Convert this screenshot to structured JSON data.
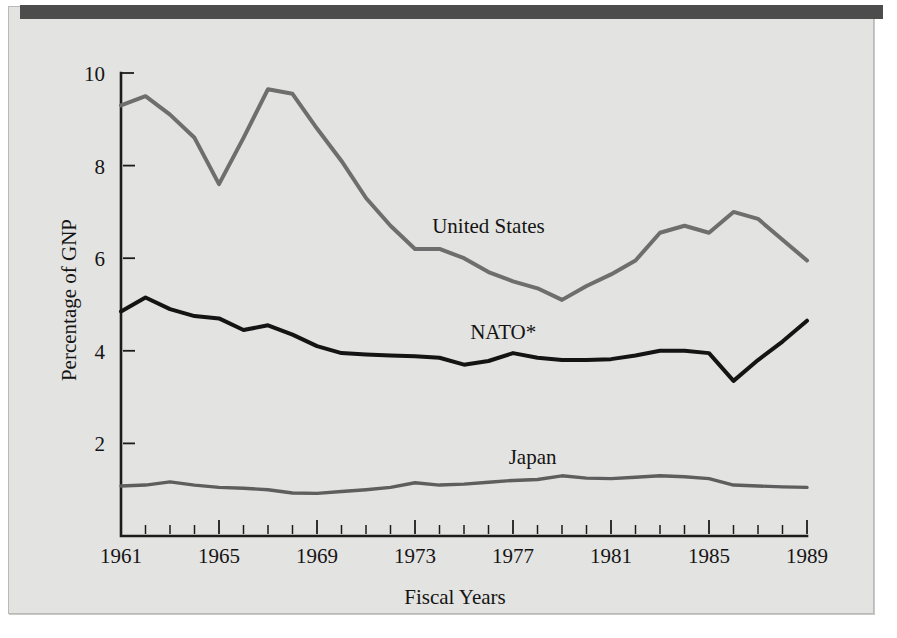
{
  "figure": {
    "background_color": "#e3e3e1",
    "topbar_color": "#4c4c4c",
    "frame_color": "#b9b9b7"
  },
  "chart_data": {
    "type": "line",
    "title": "",
    "xlabel": "Fiscal Years",
    "ylabel": "Percentage of GNP",
    "xlim": [
      1961,
      1989
    ],
    "ylim": [
      0,
      10
    ],
    "grid": false,
    "legend_position": "inline-labels",
    "x_tick_labels": [
      "1961",
      "1965",
      "1969",
      "1973",
      "1977",
      "1981",
      "1985",
      "1989"
    ],
    "x_tick_values": [
      1961,
      1965,
      1969,
      1973,
      1977,
      1981,
      1985,
      1989
    ],
    "x_minor_ticks_every": 1,
    "y_tick_labels": [
      "2",
      "4",
      "6",
      "8",
      "10"
    ],
    "y_tick_values": [
      2,
      4,
      6,
      8,
      10
    ],
    "x": [
      1961,
      1962,
      1963,
      1964,
      1965,
      1966,
      1967,
      1968,
      1969,
      1970,
      1971,
      1972,
      1973,
      1974,
      1975,
      1976,
      1977,
      1978,
      1979,
      1980,
      1981,
      1982,
      1983,
      1984,
      1985,
      1986,
      1987,
      1988,
      1989
    ],
    "series": [
      {
        "name": "United States",
        "color": "#6e6e6e",
        "stroke_width": 4.0,
        "label_x": 1976.0,
        "label_y": 6.55,
        "values": [
          9.3,
          9.5,
          9.1,
          8.6,
          7.6,
          8.6,
          9.65,
          9.55,
          8.8,
          8.1,
          7.3,
          6.7,
          6.2,
          6.2,
          6.0,
          5.7,
          5.5,
          5.35,
          5.1,
          5.4,
          5.65,
          5.95,
          6.55,
          6.7,
          6.55,
          7.0,
          6.85,
          6.4,
          5.95
        ]
      },
      {
        "name": "NATO*",
        "color": "#141414",
        "stroke_width": 4.0,
        "label_x": 1976.6,
        "label_y": 4.25,
        "values": [
          4.85,
          5.15,
          4.9,
          4.75,
          4.7,
          4.45,
          4.55,
          4.35,
          4.1,
          3.95,
          3.92,
          3.9,
          3.88,
          3.85,
          3.7,
          3.78,
          3.95,
          3.85,
          3.8,
          3.8,
          3.82,
          3.9,
          4.0,
          4.0,
          3.95,
          3.35,
          3.8,
          4.2,
          4.65
        ]
      },
      {
        "name": "Japan",
        "color": "#5e5e5e",
        "stroke_width": 3.4,
        "label_x": 1977.8,
        "label_y": 1.55,
        "values": [
          1.08,
          1.1,
          1.17,
          1.1,
          1.05,
          1.03,
          1.0,
          0.93,
          0.92,
          0.96,
          1.0,
          1.05,
          1.15,
          1.1,
          1.12,
          1.16,
          1.2,
          1.22,
          1.3,
          1.25,
          1.24,
          1.27,
          1.3,
          1.28,
          1.24,
          1.1,
          1.08,
          1.06,
          1.05
        ]
      }
    ]
  }
}
